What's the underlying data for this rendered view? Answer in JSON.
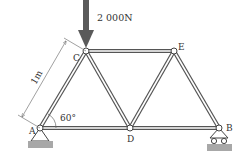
{
  "diagram": {
    "type": "truss",
    "load": {
      "label": "2 000N",
      "node": "C",
      "direction": "down",
      "color": "#5a5a5a"
    },
    "dimension": {
      "label": "1m",
      "member": "AC"
    },
    "angle": {
      "label": "60°",
      "at": "A"
    },
    "nodes": [
      {
        "id": "A",
        "label": "A",
        "support": "pin"
      },
      {
        "id": "B",
        "label": "B",
        "support": "roller"
      },
      {
        "id": "C",
        "label": "C"
      },
      {
        "id": "D",
        "label": "D"
      },
      {
        "id": "E",
        "label": "E"
      }
    ],
    "members": [
      [
        "A",
        "C"
      ],
      [
        "C",
        "D"
      ],
      [
        "A",
        "D"
      ],
      [
        "C",
        "E"
      ],
      [
        "D",
        "E"
      ],
      [
        "E",
        "B"
      ],
      [
        "D",
        "B"
      ]
    ],
    "colors": {
      "member": "#555555",
      "ground": "#a8a8a8",
      "text": "#333333"
    }
  }
}
